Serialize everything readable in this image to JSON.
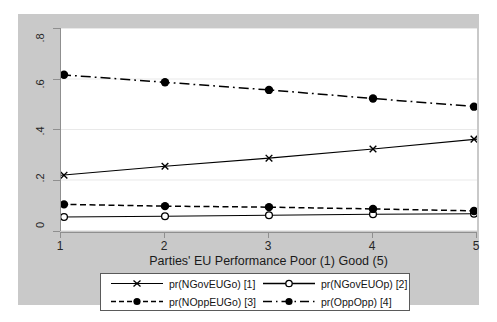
{
  "chart_data": {
    "type": "line",
    "title": "",
    "subtitle": "",
    "xlabel": "Parties' EU Performance Poor (1) Good (5)",
    "ylabel": "",
    "x": [
      1,
      2,
      3,
      4,
      5
    ],
    "xticklabels": [
      "1",
      "2",
      "3",
      "4",
      "5"
    ],
    "yticklabels": [
      "0",
      ".2",
      ".4",
      ".6",
      ".8"
    ],
    "ytickvalues": [
      0,
      0.2,
      0.4,
      0.6,
      0.8
    ],
    "xlim": [
      1,
      5
    ],
    "ylim": [
      0,
      0.8
    ],
    "grid": "horizontal",
    "legend_position": "bottom",
    "series": [
      {
        "name": "pr(NGovEUGo) [1]",
        "values": [
          0.22,
          0.255,
          0.287,
          0.323,
          0.362
        ],
        "linestyle": "solid",
        "marker": "x-cross",
        "color": "#000000"
      },
      {
        "name": "pr(NGovEUOp) [2]",
        "values": [
          0.055,
          0.058,
          0.062,
          0.066,
          0.068
        ],
        "linestyle": "solid",
        "marker": "open-circle",
        "color": "#000000"
      },
      {
        "name": "pr(NOppEUGo) [3]",
        "values": [
          0.105,
          0.098,
          0.094,
          0.087,
          0.079
        ],
        "linestyle": "dashed",
        "marker": "filled-circle",
        "color": "#000000"
      },
      {
        "name": "pr(OppOpp) [4]",
        "values": [
          0.616,
          0.586,
          0.556,
          0.522,
          0.49
        ],
        "linestyle": "dash-dot",
        "marker": "filled-circle",
        "color": "#000000"
      }
    ]
  },
  "colors": {
    "background": "#c9c9c9",
    "plot_background": "#ffffff",
    "axis": "#8f8f8f",
    "gridline": "#e8e8e8",
    "ink": "#000000"
  },
  "legend": {
    "entries": [
      {
        "label": "pr(NGovEUGo) [1]"
      },
      {
        "label": "pr(NGovEUOp) [2]"
      },
      {
        "label": "pr(NOppEUGo) [3]"
      },
      {
        "label": "pr(OppOpp) [4]"
      }
    ]
  }
}
